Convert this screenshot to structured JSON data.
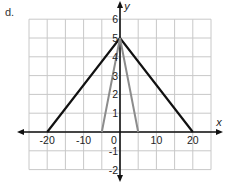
{
  "figure": {
    "part_label": "d."
  },
  "chart_data": {
    "type": "line",
    "title": "",
    "xlabel": "x",
    "ylabel": "y",
    "xlim": [
      -25,
      25
    ],
    "ylim": [
      -2,
      6
    ],
    "grid": true,
    "x_grid_step": 5,
    "y_grid_step": 1,
    "x_tick_labels": [
      "-20",
      "-10",
      "0",
      "10",
      "20"
    ],
    "x_ticks": [
      -20,
      -10,
      0,
      10,
      20
    ],
    "y_tick_labels": [
      "-2",
      "-1",
      "1",
      "2",
      "3",
      "4",
      "5",
      "6"
    ],
    "y_ticks": [
      -2,
      -1,
      1,
      2,
      3,
      4,
      5,
      6
    ],
    "legend": null,
    "series": [
      {
        "name": "wide triangle",
        "color": "#111111",
        "points": [
          [
            -20,
            0
          ],
          [
            0,
            5
          ],
          [
            20,
            0
          ]
        ]
      },
      {
        "name": "narrow triangle",
        "color": "#8c8c8c",
        "points": [
          [
            -5,
            0
          ],
          [
            0,
            5
          ],
          [
            5,
            0
          ]
        ]
      }
    ]
  },
  "colors": {
    "axis": "#111111",
    "grid": "#c8c8c8",
    "tick_text": "#222222"
  }
}
